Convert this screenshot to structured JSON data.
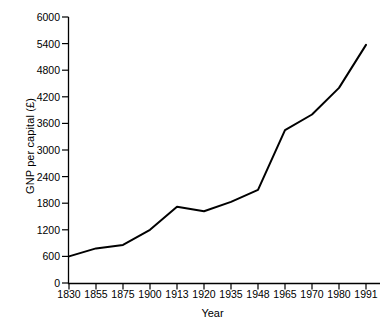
{
  "chart_data": {
    "type": "line",
    "title": "",
    "xlabel": "Year",
    "ylabel": "GNP per capital (£)",
    "categories": [
      "1830",
      "1855",
      "1875",
      "1900",
      "1913",
      "1920",
      "1935",
      "1948",
      "1965",
      "1970",
      "1980",
      "1991"
    ],
    "values": [
      600,
      780,
      860,
      1200,
      1720,
      1620,
      1830,
      2100,
      3450,
      3800,
      4400,
      5370
    ],
    "series": [
      {
        "name": "GNP per capital",
        "values": [
          600,
          780,
          860,
          1200,
          1720,
          1620,
          1830,
          2100,
          3450,
          3800,
          4400,
          5370
        ]
      }
    ],
    "ylim": [
      0,
      6000
    ],
    "yticks": [
      0,
      600,
      1200,
      1800,
      2400,
      3000,
      3600,
      4200,
      4800,
      5400,
      6000
    ],
    "ytick_labels": [
      "0",
      "600",
      "1200",
      "1800",
      "2400",
      "3000",
      "3600",
      "4200",
      "4800",
      "5400",
      "6000"
    ],
    "xtick_labels": [
      "1830",
      "1855",
      "1875",
      "1900",
      "1913",
      "1920",
      "1935",
      "1948",
      "1965",
      "1970",
      "1980",
      "1991"
    ],
    "grid": false,
    "legend": false,
    "legend_position": "none",
    "line_color": "#000000",
    "axis_color": "#000000",
    "background_color": "#ffffff",
    "x_axis_scale": "categorical-evenly-spaced"
  },
  "axis": {
    "y_title": "GNP per capital (£)",
    "x_title": "Year"
  }
}
